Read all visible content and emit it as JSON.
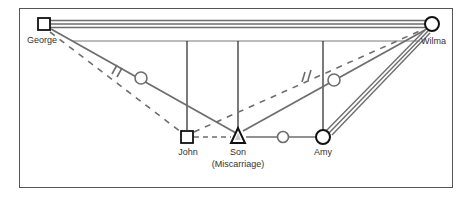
{
  "diagram": {
    "type": "genogram",
    "colors": {
      "border": "#555555",
      "line_gray": "#6e6e6e",
      "line_dark": "#222222",
      "node_stroke": "#111111"
    },
    "people": [
      {
        "id": "george",
        "name": "George",
        "sex": "male",
        "shape": "square"
      },
      {
        "id": "wilma",
        "name": "Wilma",
        "sex": "female",
        "shape": "circle"
      },
      {
        "id": "john",
        "name": "John",
        "sex": "male",
        "shape": "square"
      },
      {
        "id": "son",
        "name": "Son",
        "note": "(Miscarriage)",
        "sex": "male",
        "shape": "triangle"
      },
      {
        "id": "amy",
        "name": "Amy",
        "sex": "female",
        "shape": "circle"
      }
    ],
    "relationships": [
      {
        "from": "George",
        "to": "Wilma",
        "style": "triple-line"
      },
      {
        "from": "George",
        "to": "John",
        "style": "dashed"
      },
      {
        "from": "George",
        "to": "Son",
        "style": "solid",
        "markers": [
          "cut-off-hash",
          "small-circle"
        ]
      },
      {
        "from": "John",
        "to": "Son",
        "style": "dashed"
      },
      {
        "from": "John",
        "to": "Wilma",
        "style": "dashed",
        "markers": [
          "cut-off-hash"
        ]
      },
      {
        "from": "Son",
        "to": "Wilma",
        "style": "solid",
        "markers": [
          "small-circle"
        ]
      },
      {
        "from": "Son",
        "to": "Amy",
        "style": "solid",
        "markers": [
          "small-circle"
        ]
      },
      {
        "from": "Amy",
        "to": "Wilma",
        "style": "triple-line"
      }
    ]
  }
}
